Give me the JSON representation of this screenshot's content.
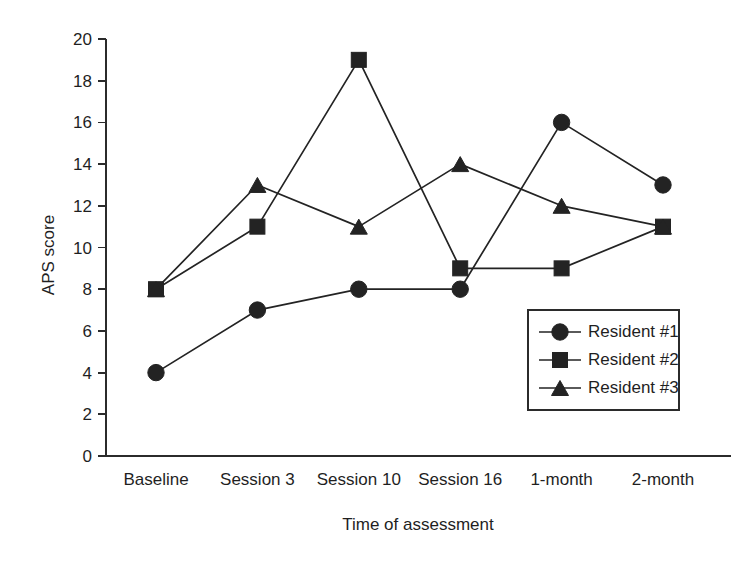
{
  "chart_data": {
    "type": "line",
    "title": "",
    "subtitle": "",
    "xlabel": "Time of assessment",
    "ylabel": "APS score",
    "categories": [
      "Baseline",
      "Session 3",
      "Session 10",
      "Session 16",
      "1-month",
      "2-month"
    ],
    "ylim": [
      0,
      20
    ],
    "yticks": [
      0,
      2,
      4,
      6,
      8,
      10,
      12,
      14,
      16,
      18,
      20
    ],
    "grid": false,
    "legend_position": "inside-lower-right",
    "series": [
      {
        "name": "Resident #1",
        "marker": "circle",
        "values": [
          4,
          7,
          8,
          8,
          16,
          13
        ]
      },
      {
        "name": "Resident #2",
        "marker": "square",
        "values": [
          8,
          11,
          19,
          9,
          9,
          11
        ]
      },
      {
        "name": "Resident #3",
        "marker": "triangle",
        "values": [
          8,
          13,
          11,
          14,
          12,
          11
        ]
      }
    ],
    "colors": {
      "line": "#232323",
      "marker": "#232323",
      "axis": "#2b2b2b",
      "background": "#ffffff"
    },
    "annotations": []
  }
}
